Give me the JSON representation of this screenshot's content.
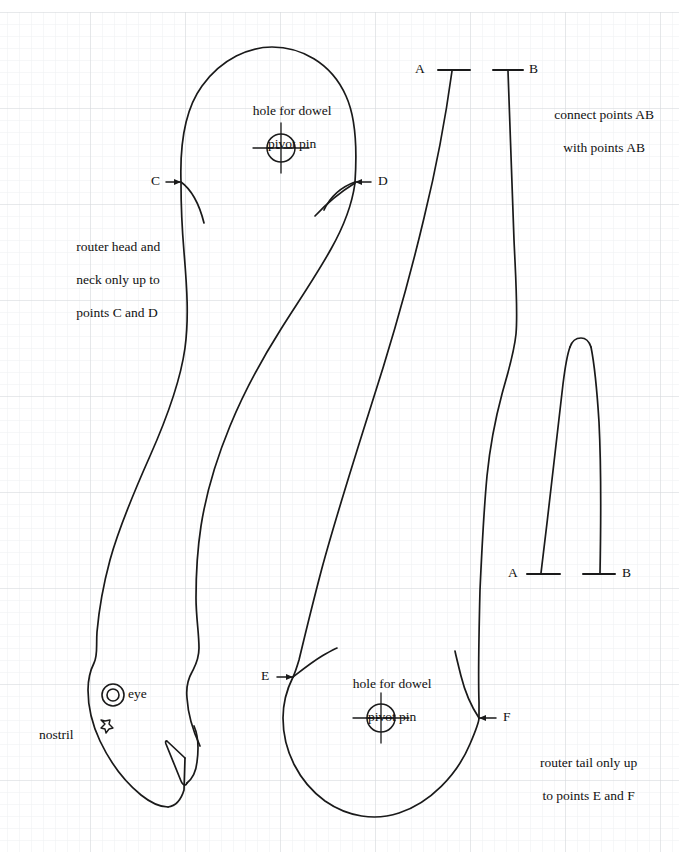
{
  "sheet": {
    "width": 679,
    "height": 865,
    "background_color": "#ffffff",
    "ink_color": "#1a1a1a",
    "grid": {
      "minor_color": "#eceef0",
      "major_color": "#d4d7da",
      "minor_spacing_px": 12,
      "major_spacing_px": 95,
      "origin_x": 0,
      "origin_y": 12
    }
  },
  "annotations": {
    "hole_head": "hole for dowel\npivot pin",
    "hole_head_line1": "hole for dowel",
    "hole_head_line2": "pivot pin",
    "hole_tail_line1": "hole for dowel",
    "hole_tail_line2": "pivot pin",
    "connect_ab_line1": "connect points AB",
    "connect_ab_line2": "with points AB",
    "head_neck_line1": "router head and",
    "head_neck_line2": "neck only up to",
    "head_neck_line3": "points C and D",
    "tail_line1": "router tail only up",
    "tail_line2": "to points E and F",
    "eye": "eye",
    "nostril": "nostril"
  },
  "point_labels": {
    "A_top": "A",
    "B_top": "B",
    "A_bottom": "A",
    "B_bottom": "B",
    "C": "C",
    "D": "D",
    "E": "E",
    "F": "F"
  },
  "features": [
    {
      "name": "dowel-hole-head",
      "cx": 281,
      "cy": 148,
      "r": 14
    },
    {
      "name": "dowel-hole-tail",
      "cx": 381,
      "cy": 718,
      "r": 14
    },
    {
      "name": "eye",
      "cx": 113,
      "cy": 695,
      "r_outer": 11,
      "r_inner": 6
    },
    {
      "name": "nostril",
      "cx": 105,
      "cy": 724,
      "r": 5
    }
  ],
  "leader_arrows": [
    {
      "name": "arrow-C",
      "label": "C",
      "direction": "right",
      "tip_x": 181,
      "tip_y": 182
    },
    {
      "name": "arrow-D",
      "label": "D",
      "direction": "left",
      "tip_x": 355,
      "tip_y": 182
    },
    {
      "name": "arrow-E",
      "label": "E",
      "direction": "right",
      "tip_x": 293,
      "tip_y": 677
    },
    {
      "name": "arrow-F",
      "label": "F",
      "direction": "left",
      "tip_x": 479,
      "tip_y": 718
    }
  ],
  "tick_marks": [
    {
      "name": "tick-A-top",
      "label": "A",
      "x1": 438,
      "x2": 470,
      "y": 70
    },
    {
      "name": "tick-B-top",
      "label": "B",
      "x1": 493,
      "x2": 523,
      "y": 70
    },
    {
      "name": "tick-A-bottom",
      "label": "A",
      "x1": 527,
      "x2": 560,
      "y": 574
    },
    {
      "name": "tick-B-bottom",
      "label": "B",
      "x1": 583,
      "x2": 615,
      "y": 574
    }
  ]
}
